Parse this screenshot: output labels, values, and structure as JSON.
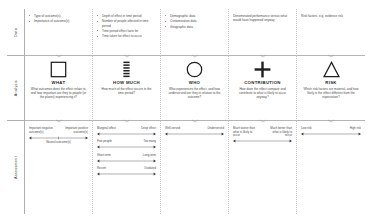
{
  "rows": {
    "data_label": "Data",
    "analysis_label": "Analysis",
    "assessment_label": "Assessment"
  },
  "columns": [
    {
      "key": "what",
      "icon": "square-icon",
      "title": "WHAT",
      "description": "What outcomes does the effect relate to, and how important are they to people (or the planet) experiencing it?",
      "data_items": [
        "Type of outcome(s)",
        "Importance of outcome(s)"
      ],
      "scales": [
        {
          "left": "Important negative outcome(s)",
          "right": "Important positive outcome(s)",
          "middle": "Neutral outcome(s)"
        }
      ]
    },
    {
      "key": "how-much",
      "icon": "bars-icon",
      "title": "HOW MUCH",
      "description": "How much of the effect occurs in the time period?",
      "data_items": [
        "Depth of effect in time period",
        "Number of people affected in time period",
        "Time period effect lasts for",
        "Time taken for effect to occur"
      ],
      "scales": [
        {
          "left": "Marginal effect",
          "right": "Deep effect",
          "middle": ""
        },
        {
          "left": "Few people",
          "right": "Too many",
          "middle": ""
        },
        {
          "left": "Short-term",
          "right": "Long-term",
          "middle": ""
        },
        {
          "left": "Recent",
          "right": "Outdated",
          "middle": ""
        }
      ]
    },
    {
      "key": "who",
      "icon": "circle-icon",
      "title": "WHO",
      "description": "Who experiences the effect, and how underserved are they in relation to the outcome?",
      "data_items": [
        "Demographic data",
        "Customisation data",
        "Geographic data"
      ],
      "scales": [
        {
          "left": "Well-served",
          "right": "Underserved",
          "middle": ""
        }
      ]
    },
    {
      "key": "contribution",
      "icon": "plus-icon",
      "title": "CONTRIBUTION",
      "description": "How does the effect compare and contribute to what is likely to occur anyway?",
      "data_items": [
        "Denominated performance versus what would have happened anyway"
      ],
      "scales": [
        {
          "left": "Much worse than what is likely to occur",
          "right": "Much better than what is likely to occur",
          "middle": ""
        }
      ]
    },
    {
      "key": "risk",
      "icon": "triangle-icon",
      "title": "RISK",
      "description": "Which risk factors are material, and how likely is the effect different from the expectation?",
      "data_items": [
        "Risk factors, e.g. evidence risk"
      ],
      "scales": [
        {
          "left": "Low risk",
          "right": "High risk",
          "middle": ""
        }
      ]
    }
  ],
  "connector": {
    "icon": "chevron-down-icon"
  },
  "colors": {
    "stroke": "#1f1f1f",
    "grid_line": "#b5b5b5",
    "dotted_line": "#c2c2c2",
    "text": "#4a4a4a"
  }
}
